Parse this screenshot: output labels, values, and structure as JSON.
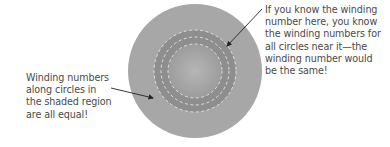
{
  "diagram": {
    "colors": {
      "outer_disk": "#a7a7a7",
      "annulus": "#8e8e8e",
      "inner_disk_center": "#b4b4b4",
      "inner_disk_edge": "#9c9c9c",
      "dashed_circles": "#e6e6e6",
      "arrows": "#222222",
      "text": "#4a4a4a"
    },
    "circle": {
      "cx": 195,
      "cy": 71,
      "r": 67
    },
    "shaded_annulus": {
      "outer_r": 41,
      "inner_r": 27
    },
    "dashed_circles_r": [
      41,
      34,
      27
    ]
  },
  "annotations": {
    "left": {
      "lines": [
        "Winding numbers",
        "along circles in",
        "the shaded region",
        "are all equal!"
      ]
    },
    "right": {
      "lines": [
        "If you know the winding",
        "number here, you know",
        "the winding numbers for",
        "all circles near it—the",
        "winding number would",
        "be the same!"
      ]
    }
  }
}
